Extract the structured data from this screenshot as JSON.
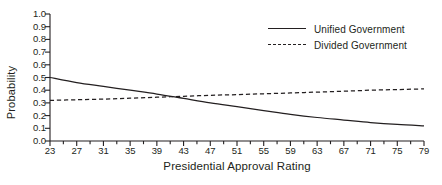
{
  "chart_data": {
    "type": "line",
    "title": "",
    "xlabel": "Presidential Approval Rating",
    "ylabel": "Probability",
    "xlim": [
      23,
      79
    ],
    "ylim": [
      0.0,
      1.0
    ],
    "grid": false,
    "legend_position": "top-right-inside",
    "x_major_ticks": [
      23,
      27,
      31,
      35,
      39,
      43,
      47,
      51,
      55,
      59,
      63,
      67,
      71,
      75,
      79
    ],
    "x_minor_tick_step": 2,
    "x_tick_labels": [
      "23",
      "27",
      "31",
      "35",
      "39",
      "43",
      "47",
      "51",
      "55",
      "59",
      "63",
      "67",
      "71",
      "75",
      "79"
    ],
    "y_ticks": [
      0.0,
      0.1,
      0.2,
      0.3,
      0.4,
      0.5,
      0.6,
      0.7,
      0.8,
      0.9,
      1.0
    ],
    "y_tick_labels": [
      "0.0",
      "0.1",
      "0.2",
      "0.3",
      "0.4",
      "0.5",
      "0.6",
      "0.7",
      "0.8",
      "0.9",
      "1.0"
    ],
    "x": [
      23,
      27,
      31,
      35,
      39,
      43,
      47,
      51,
      55,
      59,
      63,
      67,
      71,
      75,
      79
    ],
    "series": [
      {
        "name": "Unified Government",
        "style": "solid",
        "color": "#231f20",
        "values": [
          0.5,
          0.46,
          0.43,
          0.4,
          0.37,
          0.335,
          0.3,
          0.27,
          0.24,
          0.21,
          0.185,
          0.165,
          0.145,
          0.13,
          0.12
        ]
      },
      {
        "name": "Divided Government",
        "style": "dashed",
        "color": "#231f20",
        "values": [
          0.32,
          0.325,
          0.33,
          0.337,
          0.345,
          0.352,
          0.36,
          0.365,
          0.372,
          0.378,
          0.385,
          0.392,
          0.4,
          0.405,
          0.41
        ]
      }
    ],
    "annotations": []
  },
  "legend": {
    "items": [
      {
        "label": "Unified Government",
        "style": "solid"
      },
      {
        "label": "Divided Government",
        "style": "dashed"
      }
    ]
  },
  "axes": {
    "x_title": "Presidential Approval Rating",
    "y_title": "Probability"
  }
}
